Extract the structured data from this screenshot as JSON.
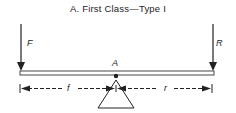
{
  "title": "A.  First Class—Type I",
  "labels": {
    "effort": "F",
    "resistance": "R",
    "fulcrum": "A",
    "effort_arm": "f",
    "resistance_arm": "r"
  }
}
